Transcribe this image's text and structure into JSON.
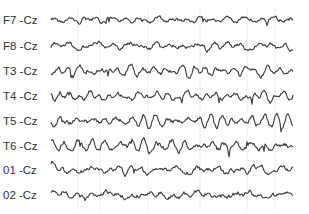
{
  "chart_data": {
    "type": "line",
    "title": "",
    "xlabel": "",
    "ylabel": "",
    "grid": "vertical-lines",
    "legend": "none",
    "trace_color": "#3a3a3a",
    "grid_color": "#e6e6e6",
    "series": [
      {
        "name": "F7 -Cz",
        "seed": 7,
        "amplitude": 0.8,
        "character": "low-amplitude fast with occasional spikes"
      },
      {
        "name": "F8 -Cz",
        "seed": 13,
        "amplitude": 0.85,
        "character": "irregular mixed"
      },
      {
        "name": "T3 -Cz",
        "seed": 21,
        "amplitude": 1.0,
        "character": "mixed with sharp deflections"
      },
      {
        "name": "T4 -Cz",
        "seed": 29,
        "amplitude": 0.8,
        "character": "irregular mixed"
      },
      {
        "name": "T5 -Cz",
        "seed": 37,
        "amplitude": 1.0,
        "character": "rhythmic"
      },
      {
        "name": "T6 -Cz",
        "seed": 43,
        "amplitude": 1.05,
        "character": "rhythmic"
      },
      {
        "name": "01 -Cz",
        "seed": 51,
        "amplitude": 1.0,
        "character": "rhythmic alpha-like"
      },
      {
        "name": "02 -Cz",
        "seed": 59,
        "amplitude": 1.0,
        "character": "rhythmic alpha-like"
      }
    ]
  }
}
